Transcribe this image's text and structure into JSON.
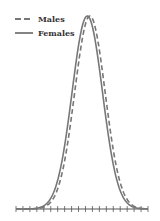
{
  "chart_data": {
    "type": "line",
    "title": "",
    "xlabel": "",
    "ylabel": "",
    "grid": false,
    "legend_position": "upper-left",
    "x_ticks_count": 20,
    "x_tick_labels": [],
    "series": [
      {
        "name": "Males",
        "style": "dashed",
        "color": "#777777",
        "shape": "normal-distribution",
        "peak_x_fraction": 0.56,
        "sd_fraction": 0.115
      },
      {
        "name": "Females",
        "style": "solid",
        "color": "#777777",
        "shape": "normal-distribution",
        "peak_x_fraction": 0.54,
        "sd_fraction": 0.115
      }
    ]
  },
  "legend": {
    "items": [
      {
        "label": "Males",
        "style": "dashed"
      },
      {
        "label": "Females",
        "style": "solid"
      }
    ]
  },
  "colors": {
    "line": "#777777",
    "axis": "#555555",
    "text": "#333333"
  }
}
